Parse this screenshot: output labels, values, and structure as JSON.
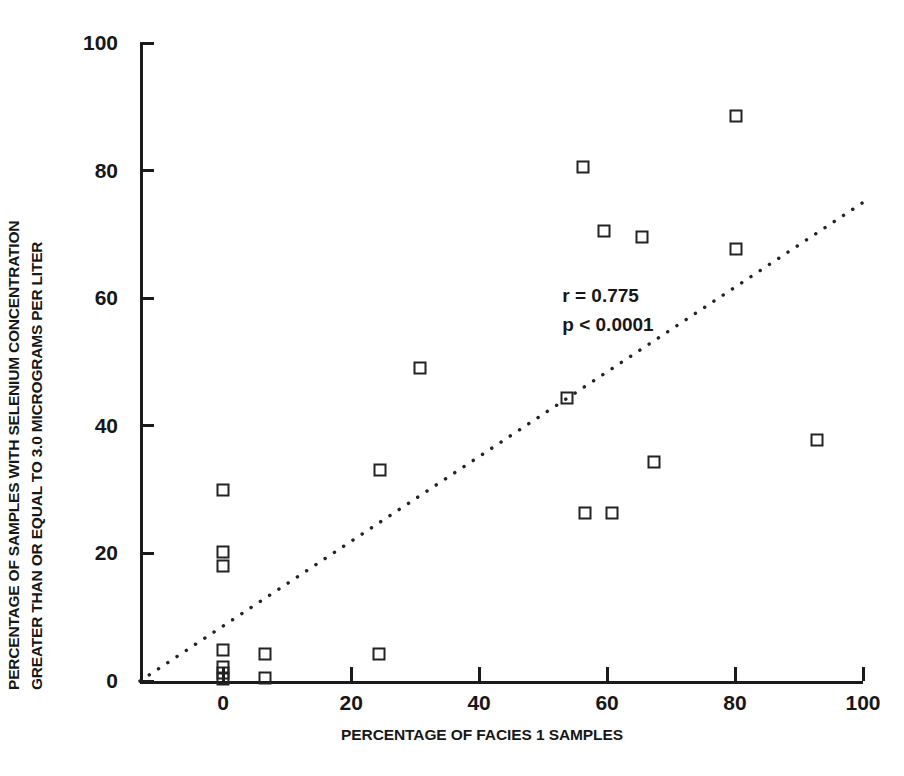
{
  "chart_data": {
    "type": "scatter",
    "title": "",
    "xlabel": "PERCENTAGE OF FACIES 1 SAMPLES",
    "ylabel_line1": "PERCENTAGE OF SAMPLES WITH SELENIUM CONCENTRATION",
    "ylabel_line2": "GREATER THAN OR EQUAL TO 3.0 MICROGRAMS PER LITER",
    "xlim": [
      -13,
      100
    ],
    "ylim": [
      0,
      100
    ],
    "xticks": [
      0,
      20,
      40,
      60,
      80,
      100
    ],
    "yticks": [
      0,
      20,
      40,
      60,
      80,
      100
    ],
    "xtick_labels": [
      "0",
      "20",
      "40",
      "60",
      "80",
      "100"
    ],
    "ytick_labels": [
      "0",
      "20",
      "40",
      "60",
      "80",
      "100"
    ],
    "grid": false,
    "legend": null,
    "marker": "open-square",
    "marker_color": "#232323",
    "points": [
      {
        "x": 0,
        "y": 0.3
      },
      {
        "x": 0,
        "y": 1.2
      },
      {
        "x": 0,
        "y": 2.2
      },
      {
        "x": 0,
        "y": 4.8
      },
      {
        "x": 0,
        "y": 18.0
      },
      {
        "x": 0,
        "y": 20.2
      },
      {
        "x": 0,
        "y": 30.0
      },
      {
        "x": 6.5,
        "y": 0.4
      },
      {
        "x": 6.5,
        "y": 4.3
      },
      {
        "x": 24.3,
        "y": 4.3
      },
      {
        "x": 24.5,
        "y": 33.0
      },
      {
        "x": 30.8,
        "y": 49.0
      },
      {
        "x": 53.8,
        "y": 44.4
      },
      {
        "x": 56.3,
        "y": 80.5
      },
      {
        "x": 56.5,
        "y": 26.3
      },
      {
        "x": 59.5,
        "y": 70.5
      },
      {
        "x": 60.7,
        "y": 26.3
      },
      {
        "x": 65.4,
        "y": 69.6
      },
      {
        "x": 67.4,
        "y": 34.4
      },
      {
        "x": 80.1,
        "y": 67.7
      },
      {
        "x": 80.1,
        "y": 88.6
      },
      {
        "x": 92.8,
        "y": 37.7
      }
    ],
    "trendline": {
      "style": "dotted",
      "color": "#232323",
      "x_start": -13.0,
      "y_start": 0.0,
      "x_end": 100.0,
      "y_end": 75.0
    },
    "annotations": [
      {
        "text": "r = 0.775",
        "x": 53,
        "y": 60.5
      },
      {
        "text": "p < 0.0001",
        "x": 53,
        "y": 56.0
      }
    ]
  }
}
